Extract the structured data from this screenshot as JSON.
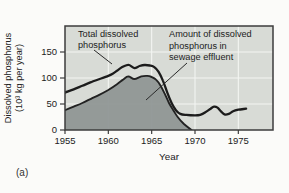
{
  "figure": {
    "caption": "(a)"
  },
  "colors": {
    "page_bg": "#fbfbf9",
    "plot_bg": "#d8dbd6",
    "area_fill": "#8e9493",
    "line_color": "#1c1c1c",
    "area_outline": "#222222",
    "grid_color": "#f3f5f2",
    "border_color": "#3d3d3d",
    "text_color": "#222222"
  },
  "chart_data": {
    "type": "area",
    "title": "",
    "xlabel": "Year",
    "ylabel": "Dissolved phosphorus (10³ kg per year)",
    "ylabel_lines": [
      "Dissolved phosphorus",
      "(10³ kg per year)"
    ],
    "xlim": [
      1955,
      1979
    ],
    "ylim": [
      0,
      200
    ],
    "x_ticks": [
      1955,
      1960,
      1965,
      1970,
      1975
    ],
    "y_ticks": [
      0,
      50,
      100,
      150
    ],
    "grid": true,
    "legend_position": "in-plot annotations",
    "series": [
      {
        "name": "Total dissolved phosphorus",
        "type": "line",
        "points": [
          [
            1955,
            72
          ],
          [
            1956,
            78
          ],
          [
            1957,
            85
          ],
          [
            1958,
            92
          ],
          [
            1959,
            98
          ],
          [
            1960,
            104
          ],
          [
            1960.5,
            108
          ],
          [
            1961,
            114
          ],
          [
            1961.5,
            120
          ],
          [
            1962,
            124
          ],
          [
            1962.4,
            125
          ],
          [
            1963,
            119
          ],
          [
            1963.6,
            123
          ],
          [
            1964.2,
            125
          ],
          [
            1964.8,
            124
          ],
          [
            1965.3,
            121
          ],
          [
            1965.8,
            112
          ],
          [
            1966.3,
            95
          ],
          [
            1966.8,
            72
          ],
          [
            1967.3,
            52
          ],
          [
            1967.8,
            38
          ],
          [
            1968.3,
            31
          ],
          [
            1969,
            29
          ],
          [
            1970,
            28
          ],
          [
            1970.6,
            29
          ],
          [
            1971.2,
            34
          ],
          [
            1971.8,
            41
          ],
          [
            1972.2,
            45
          ],
          [
            1972.6,
            43
          ],
          [
            1973,
            36
          ],
          [
            1973.4,
            30
          ],
          [
            1973.9,
            31
          ],
          [
            1974.4,
            36
          ],
          [
            1975,
            39
          ],
          [
            1975.9,
            41
          ]
        ]
      },
      {
        "name": "Amount of dissolved phosphorus in sewage effluent",
        "type": "area",
        "points": [
          [
            1955,
            38
          ],
          [
            1956,
            45
          ],
          [
            1957,
            52
          ],
          [
            1958,
            60
          ],
          [
            1959,
            68
          ],
          [
            1960,
            77
          ],
          [
            1961,
            88
          ],
          [
            1961.7,
            97
          ],
          [
            1962.3,
            103
          ],
          [
            1963,
            98
          ],
          [
            1963.8,
            103
          ],
          [
            1964.5,
            104
          ],
          [
            1965,
            102
          ],
          [
            1965.5,
            97
          ],
          [
            1966,
            86
          ],
          [
            1966.5,
            70
          ],
          [
            1967,
            52
          ],
          [
            1967.5,
            38
          ],
          [
            1968,
            25
          ],
          [
            1968.7,
            12
          ],
          [
            1969.6,
            0
          ]
        ]
      }
    ],
    "annotations": [
      {
        "lines": [
          "Total dissolved",
          "phosphorus"
        ]
      },
      {
        "lines": [
          "Amount of dissolved",
          "phosphorus in",
          "sewage effluent"
        ]
      }
    ]
  }
}
